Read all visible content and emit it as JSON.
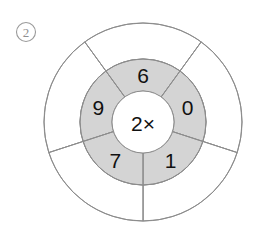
{
  "problem": {
    "marker_label": "2",
    "marker_shape": "circled-number"
  },
  "wheel": {
    "hub_label": "2×",
    "center_x": 143,
    "center_y": 122,
    "hub_radius": 31,
    "inner_ring_radius": 63,
    "outer_ring_radius": 99,
    "sector_count": 5,
    "inner_ring_fill": "#d4d4d4",
    "outer_ring_fill": "#ffffff",
    "stroke_color": "#8c8c8c",
    "sectors": [
      {
        "name": "sector-top-left",
        "inner_value": "9",
        "outer_value": "",
        "start_angle": 252,
        "end_angle": 324,
        "label_angle": 288
      },
      {
        "name": "sector-top-right",
        "inner_value": "6",
        "outer_value": "",
        "start_angle": 324,
        "end_angle": 396,
        "label_angle": 360
      },
      {
        "name": "sector-right",
        "inner_value": "0",
        "outer_value": "",
        "start_angle": 396,
        "end_angle": 468,
        "label_angle": 432
      },
      {
        "name": "sector-bottom",
        "inner_value": "1",
        "outer_value": "",
        "start_angle": 468,
        "end_angle": 540,
        "label_angle": 504
      },
      {
        "name": "sector-left",
        "inner_value": "7",
        "outer_value": "",
        "start_angle": 540,
        "end_angle": 612,
        "label_angle": 576
      }
    ]
  }
}
